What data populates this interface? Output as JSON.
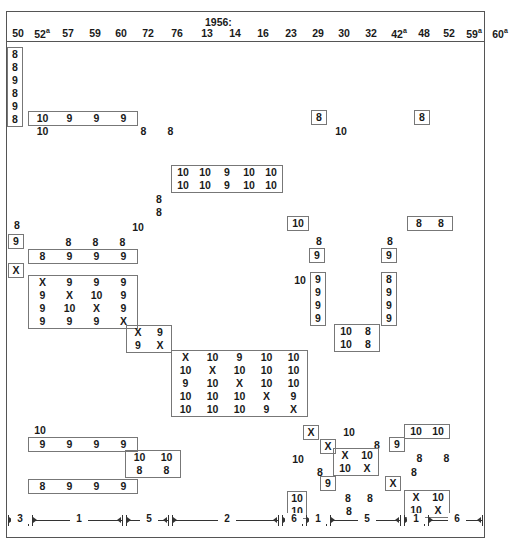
{
  "title": {
    "text": "1956:",
    "x": 205,
    "y": 16
  },
  "columns": [
    {
      "label": "50",
      "sup": "",
      "x": 7,
      "w": 22
    },
    {
      "label": "52",
      "sup": "a",
      "x": 29,
      "w": 26
    },
    {
      "label": "57",
      "sup": "",
      "x": 57,
      "w": 22
    },
    {
      "label": "59",
      "sup": "",
      "x": 84,
      "w": 22
    },
    {
      "label": "60",
      "sup": "",
      "x": 110,
      "w": 22
    },
    {
      "label": "72",
      "sup": "",
      "x": 137,
      "w": 22
    },
    {
      "label": "76",
      "sup": "",
      "x": 166,
      "w": 22
    },
    {
      "label": "13",
      "sup": "",
      "x": 196,
      "w": 22
    },
    {
      "label": "14",
      "sup": "",
      "x": 224,
      "w": 22
    },
    {
      "label": "16",
      "sup": "",
      "x": 252,
      "w": 22
    },
    {
      "label": "23",
      "sup": "",
      "x": 280,
      "w": 22
    },
    {
      "label": "29",
      "sup": "",
      "x": 307,
      "w": 22
    },
    {
      "label": "30",
      "sup": "",
      "x": 333,
      "w": 22
    },
    {
      "label": "32",
      "sup": "",
      "x": 360,
      "w": 22
    },
    {
      "label": "42",
      "sup": "a",
      "x": 386,
      "w": 26
    },
    {
      "label": "48",
      "sup": "",
      "x": 413,
      "w": 22
    },
    {
      "label": "52",
      "sup": "",
      "x": 438,
      "w": 22
    },
    {
      "label": "59",
      "sup": "a",
      "x": 461,
      "w": 26
    },
    {
      "label": "60",
      "sup": "a",
      "x": 487,
      "w": 26
    }
  ],
  "columns_y": 27,
  "groups": [
    {
      "name": "col-50-stack",
      "x": 7,
      "y": 47,
      "boxed": true,
      "cw": 14,
      "rows": [
        [
          "8"
        ],
        [
          "8"
        ],
        [
          "9"
        ],
        [
          "8"
        ],
        [
          "9"
        ],
        [
          "8"
        ]
      ]
    },
    {
      "name": "row-b1",
      "x": 28,
      "y": 111,
      "boxed": true,
      "cw": 27,
      "rows": [
        [
          "10",
          "9",
          "9",
          "9"
        ]
      ]
    },
    {
      "name": "lbl-10-a",
      "x": 29,
      "y": 125,
      "boxed": false,
      "cw": 27,
      "rows": [
        [
          "10"
        ]
      ]
    },
    {
      "name": "lbl-8-8-a",
      "x": 130,
      "y": 125,
      "boxed": false,
      "cw": 27,
      "rows": [
        [
          "8",
          "8"
        ]
      ]
    },
    {
      "name": "box-8-r1",
      "x": 311,
      "y": 110,
      "boxed": true,
      "cw": 14,
      "rows": [
        [
          "8"
        ]
      ]
    },
    {
      "name": "lbl-10-r1",
      "x": 330,
      "y": 125,
      "boxed": false,
      "cw": 22,
      "rows": [
        [
          "10"
        ]
      ]
    },
    {
      "name": "box-8-r2",
      "x": 414,
      "y": 110,
      "boxed": true,
      "cw": 14,
      "rows": [
        [
          "8"
        ]
      ]
    },
    {
      "name": "matrix-5x2-mid",
      "x": 171,
      "y": 165,
      "boxed": true,
      "cw": 22,
      "rows": [
        [
          "10",
          "10",
          "9",
          "10",
          "10"
        ],
        [
          "10",
          "10",
          "9",
          "10",
          "10"
        ]
      ]
    },
    {
      "name": "lbl-8-8-stack",
      "x": 152,
      "y": 193,
      "boxed": false,
      "cw": 14,
      "rows": [
        [
          "8"
        ],
        [
          "8"
        ]
      ]
    },
    {
      "name": "lbl-8-left",
      "x": 10,
      "y": 219,
      "boxed": false,
      "cw": 14,
      "rows": [
        [
          "8"
        ]
      ]
    },
    {
      "name": "lbl-10-mid1",
      "x": 127,
      "y": 221,
      "boxed": false,
      "cw": 22,
      "rows": [
        [
          "10"
        ]
      ]
    },
    {
      "name": "box-10-mr",
      "x": 287,
      "y": 216,
      "boxed": true,
      "cw": 20,
      "rows": [
        [
          "10"
        ]
      ]
    },
    {
      "name": "row-8-8-rr",
      "x": 407,
      "y": 216,
      "boxed": true,
      "cw": 22,
      "rows": [
        [
          "8",
          "8"
        ]
      ]
    },
    {
      "name": "box-9-left",
      "x": 8,
      "y": 234,
      "boxed": true,
      "cw": 14,
      "rows": [
        [
          "9"
        ]
      ]
    },
    {
      "name": "row-8-8-8-top",
      "x": 55,
      "y": 236,
      "boxed": false,
      "cw": 27,
      "rows": [
        [
          "8",
          "8",
          "8"
        ]
      ]
    },
    {
      "name": "lbl-8-mr1",
      "x": 312,
      "y": 235,
      "boxed": false,
      "cw": 14,
      "rows": [
        [
          "8"
        ]
      ]
    },
    {
      "name": "lbl-8-rr1",
      "x": 383,
      "y": 235,
      "boxed": false,
      "cw": 14,
      "rows": [
        [
          "8"
        ]
      ]
    },
    {
      "name": "row-8-9-9-9",
      "x": 28,
      "y": 249,
      "boxed": true,
      "cw": 27,
      "rows": [
        [
          "8",
          "9",
          "9",
          "9"
        ]
      ]
    },
    {
      "name": "box-9-mr",
      "x": 309,
      "y": 248,
      "boxed": true,
      "cw": 14,
      "rows": [
        [
          "9"
        ]
      ]
    },
    {
      "name": "box-9-rr",
      "x": 381,
      "y": 248,
      "boxed": true,
      "cw": 14,
      "rows": [
        [
          "9"
        ]
      ]
    },
    {
      "name": "box-X-left",
      "x": 8,
      "y": 263,
      "boxed": true,
      "cw": 14,
      "rows": [
        [
          "X"
        ]
      ]
    },
    {
      "name": "lbl-10-mr2",
      "x": 289,
      "y": 274,
      "boxed": false,
      "cw": 22,
      "rows": [
        [
          "10"
        ]
      ]
    },
    {
      "name": "matrix-4x4-left",
      "x": 28,
      "y": 275,
      "boxed": true,
      "cw": 27,
      "rows": [
        [
          "X",
          "9",
          "9",
          "9"
        ],
        [
          "9",
          "X",
          "10",
          "9"
        ],
        [
          "9",
          "10",
          "X",
          "9"
        ],
        [
          "9",
          "9",
          "9",
          "X"
        ]
      ]
    },
    {
      "name": "col-9999-mr",
      "x": 310,
      "y": 272,
      "boxed": true,
      "cw": 14,
      "rows": [
        [
          "9"
        ],
        [
          "9"
        ],
        [
          "9"
        ],
        [
          "9"
        ]
      ]
    },
    {
      "name": "col-8999-rr",
      "x": 381,
      "y": 272,
      "boxed": true,
      "cw": 14,
      "rows": [
        [
          "8"
        ],
        [
          "9"
        ],
        [
          "9"
        ],
        [
          "9"
        ]
      ]
    },
    {
      "name": "matrix-2x2-mid",
      "x": 126,
      "y": 325,
      "boxed": true,
      "cw": 22,
      "rows": [
        [
          "X",
          "9"
        ],
        [
          "9",
          "X"
        ]
      ]
    },
    {
      "name": "matrix-10-8-mr",
      "x": 334,
      "y": 324,
      "boxed": true,
      "cw": 22,
      "rows": [
        [
          "10",
          "8"
        ],
        [
          "10",
          "8"
        ]
      ]
    },
    {
      "name": "matrix-5x5-center",
      "x": 171,
      "y": 350,
      "boxed": true,
      "cw": 27,
      "rows": [
        [
          "X",
          "10",
          "9",
          "10",
          "10"
        ],
        [
          "10",
          "X",
          "10",
          "10",
          "10"
        ],
        [
          "9",
          "10",
          "X",
          "10",
          "10"
        ],
        [
          "10",
          "10",
          "10",
          "X",
          "9"
        ],
        [
          "10",
          "10",
          "10",
          "9",
          "X"
        ]
      ]
    },
    {
      "name": "lbl-10-bl",
      "x": 29,
      "y": 424,
      "boxed": false,
      "cw": 22,
      "rows": [
        [
          "10"
        ]
      ]
    },
    {
      "name": "box-X-br1",
      "x": 303,
      "y": 425,
      "boxed": true,
      "cw": 14,
      "rows": [
        [
          "X"
        ]
      ]
    },
    {
      "name": "lbl-10-br1",
      "x": 338,
      "y": 426,
      "boxed": false,
      "cw": 22,
      "rows": [
        [
          "10"
        ]
      ]
    },
    {
      "name": "row-10-10-br",
      "x": 404,
      "y": 424,
      "boxed": true,
      "cw": 22,
      "rows": [
        [
          "10",
          "10"
        ]
      ]
    },
    {
      "name": "row-9-9-9-9-bl",
      "x": 28,
      "y": 437,
      "boxed": true,
      "cw": 27,
      "rows": [
        [
          "9",
          "9",
          "9",
          "9"
        ]
      ]
    },
    {
      "name": "box-X-br2",
      "x": 320,
      "y": 439,
      "boxed": true,
      "cw": 14,
      "rows": [
        [
          "X"
        ]
      ]
    },
    {
      "name": "lbl-8-br1",
      "x": 370,
      "y": 439,
      "boxed": false,
      "cw": 14,
      "rows": [
        [
          "8"
        ]
      ]
    },
    {
      "name": "box-9-br1",
      "x": 389,
      "y": 437,
      "boxed": true,
      "cw": 14,
      "rows": [
        [
          "9"
        ]
      ]
    },
    {
      "name": "matrix-10-10-8-8",
      "x": 125,
      "y": 450,
      "boxed": true,
      "cw": 27,
      "rows": [
        [
          "10",
          "10"
        ],
        [
          "8",
          "8"
        ]
      ]
    },
    {
      "name": "lbl-10-br2",
      "x": 287,
      "y": 453,
      "boxed": false,
      "cw": 22,
      "rows": [
        [
          "10"
        ]
      ]
    },
    {
      "name": "matrix-2x2-br",
      "x": 333,
      "y": 448,
      "boxed": true,
      "cw": 22,
      "rows": [
        [
          "X",
          "10"
        ],
        [
          "10",
          "X"
        ]
      ]
    },
    {
      "name": "lbl-8-8-br",
      "x": 406,
      "y": 452,
      "boxed": false,
      "cw": 27,
      "rows": [
        [
          "8",
          "8"
        ]
      ]
    },
    {
      "name": "lbl-8-br2",
      "x": 313,
      "y": 466,
      "boxed": false,
      "cw": 14,
      "rows": [
        [
          "8"
        ]
      ]
    },
    {
      "name": "lbl-8-br3",
      "x": 407,
      "y": 466,
      "boxed": false,
      "cw": 14,
      "rows": [
        [
          "8"
        ]
      ]
    },
    {
      "name": "row-8-9-9-9-bl",
      "x": 28,
      "y": 479,
      "boxed": true,
      "cw": 27,
      "rows": [
        [
          "8",
          "9",
          "9",
          "9"
        ]
      ]
    },
    {
      "name": "box-9-br2",
      "x": 320,
      "y": 476,
      "boxed": true,
      "cw": 14,
      "rows": [
        [
          "9"
        ]
      ]
    },
    {
      "name": "box-X-br3",
      "x": 385,
      "y": 476,
      "boxed": true,
      "cw": 14,
      "rows": [
        [
          "X"
        ]
      ]
    },
    {
      "name": "col-10-10-br",
      "x": 287,
      "y": 491,
      "boxed": true,
      "cw": 18,
      "rows": [
        [
          "10"
        ],
        [
          "10"
        ]
      ]
    },
    {
      "name": "lbl-8-8-br2",
      "x": 337,
      "y": 492,
      "boxed": false,
      "cw": 22,
      "rows": [
        [
          "8",
          "8"
        ]
      ]
    },
    {
      "name": "matrix-2x2-br2",
      "x": 404,
      "y": 490,
      "boxed": true,
      "cw": 22,
      "rows": [
        [
          "X",
          "10"
        ],
        [
          "10",
          "X"
        ]
      ]
    },
    {
      "name": "lbl-8-br4",
      "x": 338,
      "y": 505,
      "boxed": false,
      "cw": 22,
      "rows": [
        [
          "8"
        ]
      ]
    }
  ],
  "ruler": {
    "y": 512,
    "segments": [
      {
        "label": "3",
        "x1": 8,
        "x2": 28
      },
      {
        "label": "1",
        "x1": 32,
        "x2": 122
      },
      {
        "label": "5",
        "x1": 126,
        "x2": 168
      },
      {
        "label": "2",
        "x1": 172,
        "x2": 278
      },
      {
        "label": "6",
        "x1": 282,
        "x2": 302
      },
      {
        "label": "1",
        "x1": 306,
        "x2": 326
      },
      {
        "label": "5",
        "x1": 330,
        "x2": 400
      },
      {
        "label": "1",
        "x1": 404,
        "x2": 424
      },
      {
        "label": "6",
        "x1": 428,
        "x2": 482
      }
    ]
  }
}
